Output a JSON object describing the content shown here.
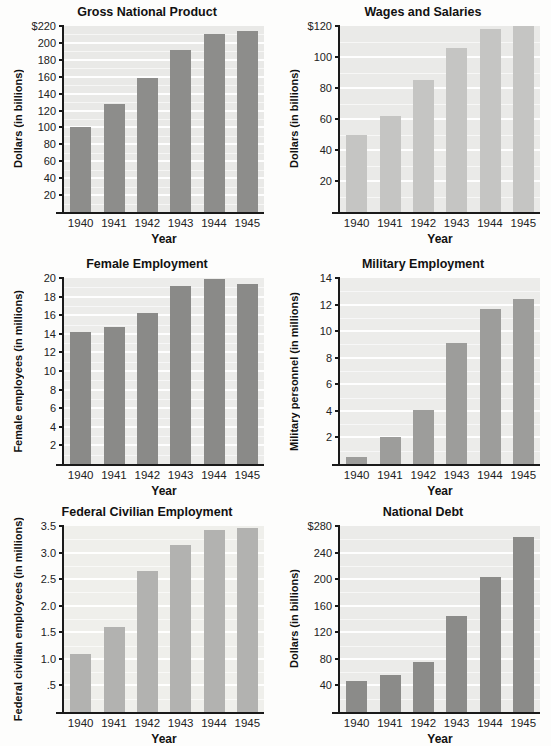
{
  "page": {
    "background": "#fdfdfc",
    "figure_type": "six-panel bar chart grid"
  },
  "chart_data": [
    {
      "type": "bar",
      "title": "Gross National Product",
      "ylabel": "Dollars (in billions)",
      "xlabel": "Year",
      "categories": [
        "1940",
        "1941",
        "1942",
        "1943",
        "1944",
        "1945"
      ],
      "values": [
        100,
        128,
        159,
        192,
        211,
        214
      ],
      "ylim": [
        0,
        220
      ],
      "ytick_values": [
        20,
        40,
        60,
        80,
        100,
        120,
        140,
        160,
        180,
        200,
        220
      ],
      "ytick_labels": [
        "20",
        "40",
        "60",
        "80",
        "100",
        "120",
        "140",
        "160",
        "180",
        "200",
        "$220"
      ],
      "grid": "on",
      "legend": "none",
      "bar_color": "#8d8d8b",
      "plot_bg": "#e9e9e7"
    },
    {
      "type": "bar",
      "title": "Wages and Salaries",
      "ylabel": "Dollars (in billions)",
      "xlabel": "Year",
      "categories": [
        "1940",
        "1941",
        "1942",
        "1943",
        "1944",
        "1945"
      ],
      "values": [
        50,
        62,
        85,
        106,
        118,
        120
      ],
      "ylim": [
        0,
        120
      ],
      "ytick_values": [
        20,
        40,
        60,
        80,
        100,
        120
      ],
      "ytick_labels": [
        "20",
        "40",
        "60",
        "80",
        "100",
        "$120"
      ],
      "grid": "on",
      "legend": "none",
      "bar_color": "#c5c5c3",
      "plot_bg": "#eaeae8"
    },
    {
      "type": "bar",
      "title": "Female Employment",
      "ylabel": "Female employees (in millions)",
      "xlabel": "Year",
      "categories": [
        "1940",
        "1941",
        "1942",
        "1943",
        "1944",
        "1945"
      ],
      "values": [
        14.2,
        14.7,
        16.2,
        19.1,
        19.9,
        19.4
      ],
      "ylim": [
        0,
        20
      ],
      "ytick_values": [
        2,
        4,
        6,
        8,
        10,
        12,
        14,
        16,
        18,
        20
      ],
      "ytick_labels": [
        "2",
        "4",
        "6",
        "8",
        "10",
        "12",
        "14",
        "16",
        "18",
        "20"
      ],
      "grid": "on",
      "legend": "none",
      "bar_color": "#8a8a88",
      "plot_bg": "#ececea"
    },
    {
      "type": "bar",
      "title": "Military Employment",
      "ylabel": "Military personnel (in millions)",
      "xlabel": "Year",
      "categories": [
        "1940",
        "1941",
        "1942",
        "1943",
        "1944",
        "1945"
      ],
      "values": [
        0.5,
        2.0,
        4.05,
        9.1,
        11.7,
        12.4
      ],
      "ylim": [
        0,
        14
      ],
      "ytick_values": [
        2,
        4,
        6,
        8,
        10,
        12,
        14
      ],
      "ytick_labels": [
        "2",
        "4",
        "6",
        "8",
        "10",
        "12",
        "14"
      ],
      "grid": "on",
      "legend": "none",
      "bar_color": "#9d9d9b",
      "plot_bg": "#ececea"
    },
    {
      "type": "bar",
      "title": "Federal Civilian Employment",
      "ylabel": "Federal civilian employees (in millions)",
      "xlabel": "Year",
      "categories": [
        "1940",
        "1941",
        "1942",
        "1943",
        "1944",
        "1945"
      ],
      "values": [
        1.1,
        1.6,
        2.65,
        3.15,
        3.42,
        3.47
      ],
      "ylim": [
        0,
        3.5
      ],
      "ytick_values": [
        0.5,
        1.0,
        1.5,
        2.0,
        2.5,
        3.0,
        3.5
      ],
      "ytick_labels": [
        ".5",
        "1.0",
        "1.5",
        "2.0",
        "2.5",
        "3.0",
        "3.5"
      ],
      "grid": "on",
      "legend": "none",
      "bar_color": "#b2b2b0",
      "plot_bg": "#efefeb"
    },
    {
      "type": "bar",
      "title": "National Debt",
      "ylabel": "Dollars (in billions)",
      "xlabel": "Year",
      "categories": [
        "1940",
        "1941",
        "1942",
        "1943",
        "1944",
        "1945"
      ],
      "values": [
        47,
        55,
        75,
        145,
        203,
        263
      ],
      "ylim": [
        0,
        280
      ],
      "ytick_values": [
        40,
        80,
        120,
        160,
        200,
        240,
        280
      ],
      "ytick_labels": [
        "40",
        "80",
        "120",
        "160",
        "200",
        "240",
        "$280"
      ],
      "grid": "on",
      "legend": "none",
      "bar_color": "#8b8b89",
      "plot_bg": "#ebebe9"
    }
  ]
}
